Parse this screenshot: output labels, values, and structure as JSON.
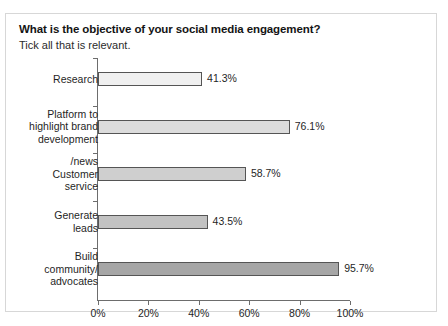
{
  "top_cutoff_text": "",
  "panel": {
    "title": "What is the objective of your social media engagement?",
    "subtitle": "Tick all that is relevant."
  },
  "chart_data": {
    "type": "bar",
    "orientation": "horizontal",
    "title": "What is the objective of your social media engagement?",
    "subtitle": "Tick all that is relevant.",
    "xlabel": "",
    "ylabel": "",
    "xlim": [
      0,
      100
    ],
    "grid": false,
    "legend": null,
    "categories": [
      "Research",
      "Platform to\nhighlight brand\ndevelopment",
      "/news\nCustomer\nservice",
      "Generate\nleads",
      "Build\ncommunity/\nadvocates"
    ],
    "values": [
      41.3,
      76.1,
      58.7,
      43.5,
      95.7
    ],
    "value_labels": [
      "41.3%",
      "76.1%",
      "58.7%",
      "43.5%",
      "95.7%"
    ],
    "bar_colors": [
      "#f0f0f0",
      "#dcdcdc",
      "#cfcfcf",
      "#c2c2c2",
      "#a6a6a6"
    ],
    "bar_border_color": "#555555",
    "xticks": [
      0,
      20,
      40,
      60,
      80,
      100
    ],
    "xtick_labels": [
      "0%",
      "20%",
      "40%",
      "60%",
      "80%",
      "100%"
    ]
  }
}
